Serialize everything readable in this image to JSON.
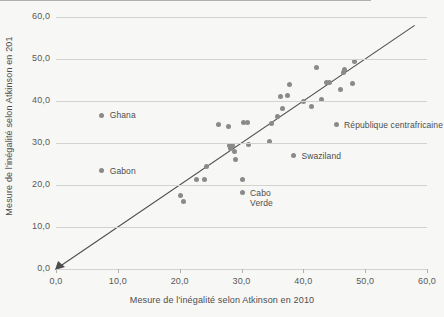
{
  "chart_data": {
    "type": "scatter",
    "title": "",
    "xlabel": "Mesure de l'inégalité selon Atkinson en 2010",
    "ylabel": "Mesure de l'inégalité selon Atkinson en 201",
    "xlim": [
      0.0,
      60.0
    ],
    "ylim": [
      0.0,
      60.0
    ],
    "grid": true,
    "legend": "none",
    "xticks": [
      "0,0",
      "10,0",
      "20,0",
      "30,0",
      "40,0",
      "50,0",
      "60,0"
    ],
    "xtick_values": [
      0,
      10,
      20,
      30,
      40,
      50,
      60
    ],
    "yticks": [
      "0,0",
      "10,0",
      "20,0",
      "30,0",
      "40,0",
      "50,0",
      "60,0"
    ],
    "ytick_values": [
      0,
      10,
      20,
      30,
      40,
      50,
      60
    ],
    "marker_color": "#8a8a8a",
    "reference_line": {
      "type": "identity",
      "from": [
        0.0,
        0.0
      ],
      "to": [
        58.0,
        58.0
      ],
      "color": "#4d4d4d",
      "arrow_at_origin": true
    },
    "points": [
      {
        "x": 7.4,
        "y": 36.6,
        "label": "Ghana"
      },
      {
        "x": 7.4,
        "y": 23.4,
        "label": "Gabon"
      },
      {
        "x": 45.3,
        "y": 34.4,
        "label": "République centrafricaine"
      },
      {
        "x": 38.4,
        "y": 27.0,
        "label": "Swaziland"
      },
      {
        "x": 30.1,
        "y": 18.2,
        "label": "Cabo Verde"
      },
      {
        "x": 20.2,
        "y": 17.4,
        "label": ""
      },
      {
        "x": 20.7,
        "y": 16.0,
        "label": ""
      },
      {
        "x": 22.7,
        "y": 21.3,
        "label": ""
      },
      {
        "x": 24.0,
        "y": 21.4,
        "label": ""
      },
      {
        "x": 24.3,
        "y": 24.3,
        "label": ""
      },
      {
        "x": 26.2,
        "y": 34.4,
        "label": ""
      },
      {
        "x": 27.9,
        "y": 33.9,
        "label": ""
      },
      {
        "x": 28.0,
        "y": 29.5,
        "label": ""
      },
      {
        "x": 28.2,
        "y": 28.6,
        "label": ""
      },
      {
        "x": 28.6,
        "y": 29.4,
        "label": ""
      },
      {
        "x": 28.9,
        "y": 28.0,
        "label": ""
      },
      {
        "x": 29.1,
        "y": 26.1,
        "label": ""
      },
      {
        "x": 30.1,
        "y": 21.2,
        "label": ""
      },
      {
        "x": 30.4,
        "y": 34.9,
        "label": ""
      },
      {
        "x": 31.0,
        "y": 34.9,
        "label": ""
      },
      {
        "x": 31.1,
        "y": 29.6,
        "label": ""
      },
      {
        "x": 34.6,
        "y": 30.4,
        "label": ""
      },
      {
        "x": 34.8,
        "y": 34.6,
        "label": ""
      },
      {
        "x": 35.9,
        "y": 36.4,
        "label": ""
      },
      {
        "x": 36.3,
        "y": 41.1,
        "label": ""
      },
      {
        "x": 36.6,
        "y": 38.2,
        "label": ""
      },
      {
        "x": 37.4,
        "y": 41.3,
        "label": ""
      },
      {
        "x": 37.8,
        "y": 43.9,
        "label": ""
      },
      {
        "x": 40.1,
        "y": 39.9,
        "label": ""
      },
      {
        "x": 41.3,
        "y": 38.6,
        "label": ""
      },
      {
        "x": 42.2,
        "y": 47.9,
        "label": ""
      },
      {
        "x": 43.0,
        "y": 40.3,
        "label": ""
      },
      {
        "x": 43.8,
        "y": 44.3,
        "label": ""
      },
      {
        "x": 44.3,
        "y": 44.3,
        "label": ""
      },
      {
        "x": 46.0,
        "y": 42.8,
        "label": ""
      },
      {
        "x": 46.5,
        "y": 46.7,
        "label": ""
      },
      {
        "x": 46.7,
        "y": 47.4,
        "label": ""
      },
      {
        "x": 47.9,
        "y": 44.2,
        "label": ""
      },
      {
        "x": 48.2,
        "y": 49.3,
        "label": ""
      }
    ],
    "annotations": [
      {
        "text": "Ghana",
        "x": 7.4,
        "y": 36.6,
        "dx": 8,
        "dy": 0,
        "lines": [
          "Ghana"
        ]
      },
      {
        "text": "Gabon",
        "x": 7.4,
        "y": 23.4,
        "dx": 8,
        "dy": 0,
        "lines": [
          "Gabon"
        ]
      },
      {
        "text": "République centrafricaine",
        "x": 45.3,
        "y": 34.4,
        "dx": 8,
        "dy": 0,
        "lines": [
          "République centrafricaine"
        ]
      },
      {
        "text": "Swaziland",
        "x": 38.4,
        "y": 27.0,
        "dx": 8,
        "dy": 0,
        "lines": [
          "Swaziland"
        ]
      },
      {
        "text": "Cabo Verde",
        "x": 30.1,
        "y": 18.2,
        "dx": 8,
        "dy": 0,
        "lines": [
          "Cabo",
          "Verde"
        ]
      }
    ]
  }
}
